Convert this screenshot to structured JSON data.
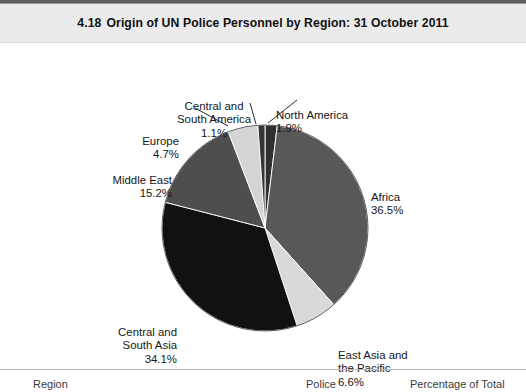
{
  "figure": {
    "number": "4.18",
    "title": "Origin of UN Police Personnel by Region: 31 October 2011"
  },
  "chart_data": {
    "type": "pie",
    "title": "Origin of UN Police Personnel by Region: 31 October 2011",
    "xlabel": "",
    "ylabel": "",
    "grid": false,
    "legend_position": "none",
    "label_format": "name + percent",
    "start_angle_deg": 0,
    "direction": "clockwise",
    "categories": [
      "North America",
      "Africa",
      "East Asia and the Pacific",
      "Central and South Asia",
      "Middle East",
      "Europe",
      "Central and South America"
    ],
    "values": [
      1.9,
      36.5,
      6.6,
      34.1,
      15.2,
      4.7,
      1.1
    ],
    "units": "percent",
    "colors": [
      "#2f2f2f",
      "#585858",
      "#d9d9d9",
      "#111111",
      "#4e4e4e",
      "#d4d4d4",
      "#353535"
    ],
    "slices": [
      {
        "name": "North America",
        "value": 1.9,
        "label": "North America",
        "value_text": "1.9%",
        "color": "#2f2f2f"
      },
      {
        "name": "Africa",
        "value": 36.5,
        "label": "Africa",
        "value_text": "36.5%",
        "color": "#585858"
      },
      {
        "name": "East Asia and the Pacific",
        "value": 6.6,
        "label": "East Asia and\nthe Pacific",
        "value_text": "6.6%",
        "color": "#d9d9d9"
      },
      {
        "name": "Central and South Asia",
        "value": 34.1,
        "label": "Central and\nSouth Asia",
        "value_text": "34.1%",
        "color": "#111111"
      },
      {
        "name": "Middle East",
        "value": 15.2,
        "label": "Middle East",
        "value_text": "15.2%",
        "color": "#4e4e4e"
      },
      {
        "name": "Europe",
        "value": 4.7,
        "label": "Europe",
        "value_text": "4.7%",
        "color": "#d4d4d4"
      },
      {
        "name": "Central and South America",
        "value": 1.1,
        "label": "Central and\nSouth America",
        "value_text": "1.1%",
        "color": "#353535"
      }
    ]
  },
  "labels": {
    "africa": {
      "line1": "Africa",
      "value": "36.5%"
    },
    "east_asia": {
      "line1": "East Asia and",
      "line2": "the Pacific",
      "value": "6.6%"
    },
    "central_south_asia": {
      "line1": "Central and",
      "line2": "South Asia",
      "value": "34.1%"
    },
    "middle_east": {
      "line1": "Middle East",
      "value": "15.2%"
    },
    "europe": {
      "line1": "Europe",
      "value": "4.7%"
    },
    "central_south_america": {
      "line1": "Central and",
      "line2": "South America",
      "value": "1.1%"
    },
    "north_america": {
      "line1": "North America",
      "value": "1.9%"
    }
  },
  "table": {
    "headers": [
      "Region",
      "Police",
      "Percentage of Total"
    ]
  },
  "colors": {
    "header_band": "#ebebeb",
    "rule": "#5d5d5d",
    "text": "#161616",
    "page_background": "#ffffff"
  }
}
